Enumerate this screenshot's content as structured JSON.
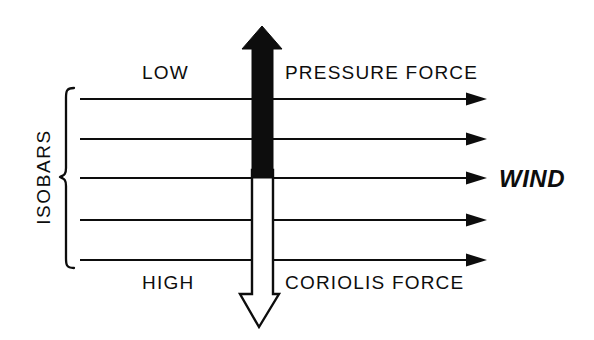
{
  "diagram": {
    "labels": {
      "low": "LOW",
      "high": "HIGH",
      "pressure_force": "PRESSURE FORCE",
      "coriolis_force": "CORIOLIS FORCE",
      "wind": "WIND",
      "isobars": "ISOBARS"
    },
    "colors": {
      "ink": "#0d0d0d",
      "background": "#ffffff",
      "pressure_arrow_fill": "#0d0d0d",
      "coriolis_arrow_fill": "#ffffff",
      "coriolis_arrow_stroke": "#0d0d0d"
    },
    "isobars": {
      "count": 5,
      "y_positions": [
        99,
        139,
        178,
        220,
        260
      ],
      "x_start": 80,
      "x_tip": 487,
      "label_side": "left",
      "brace": {
        "top": 88,
        "bottom": 268,
        "x": 62
      }
    },
    "pressure_arrow": {
      "direction": "up",
      "fill": "solid-black",
      "tip_y": 26,
      "base_y": 178,
      "center_x": 262,
      "shaft_left": 252,
      "shaft_right": 273,
      "head_left": 242,
      "head_right": 282,
      "head_base_y": 49
    },
    "coriolis_arrow": {
      "direction": "down",
      "fill": "white-outline",
      "tip_y": 327,
      "base_y": 178,
      "center_x": 259,
      "shaft_left": 252,
      "shaft_right": 273,
      "head_left": 240,
      "head_right": 279,
      "head_base_y": 294
    },
    "wind_arrow": {
      "direction": "right",
      "isobar_index": 2,
      "y": 178
    }
  }
}
